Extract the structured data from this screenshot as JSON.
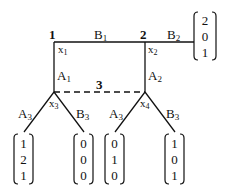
{
  "nodes": {
    "n1": {
      "label": "1",
      "var": "x",
      "sub": "1"
    },
    "n2": {
      "label": "2",
      "var": "x",
      "sub": "2"
    },
    "n3": {
      "label": "3"
    },
    "x3": {
      "var": "x",
      "sub": "3"
    },
    "x4": {
      "var": "x",
      "sub": "4"
    }
  },
  "edges": {
    "B1": {
      "main": "B",
      "sub": "1"
    },
    "B2": {
      "main": "B",
      "sub": "2"
    },
    "A1": {
      "main": "A",
      "sub": "1"
    },
    "A2": {
      "main": "A",
      "sub": "2"
    },
    "A3_left": {
      "main": "A",
      "sub": "3"
    },
    "B3_left": {
      "main": "B",
      "sub": "3"
    },
    "A3_right": {
      "main": "A",
      "sub": "3"
    },
    "B3_right": {
      "main": "B",
      "sub": "3"
    }
  },
  "payoffs": {
    "B2": [
      "2",
      "0",
      "1"
    ],
    "x3_A3": [
      "1",
      "2",
      "1"
    ],
    "x3_B3": [
      "0",
      "0",
      "0"
    ],
    "x4_A3": [
      "0",
      "1",
      "0"
    ],
    "x4_B3": [
      "1",
      "0",
      "1"
    ]
  }
}
